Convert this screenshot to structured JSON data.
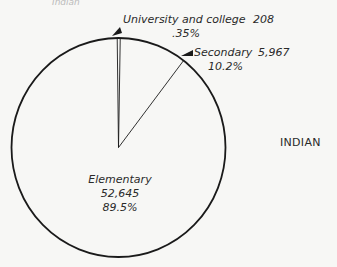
{
  "chart_data": {
    "type": "pie",
    "title": "INDIAN",
    "cut_off_text": "Indian",
    "slices": [
      {
        "label": "University and college",
        "value": 208,
        "percent_label": ".35%",
        "percent": 0.35
      },
      {
        "label": "Secondary",
        "value": 5967,
        "percent_label": "10.2%",
        "percent": 10.2
      },
      {
        "label": "Elementary",
        "value": 52645,
        "value_label": "52,645",
        "percent_label": "89.5%",
        "percent": 89.5
      }
    ],
    "value_labels": {
      "university": "208",
      "secondary": "5,967",
      "elementary": "52,645"
    },
    "start_angle": "top (12 o'clock)",
    "direction": "clockwise",
    "colors": {
      "stroke": "#1a1a1a",
      "fill": "#f7f7f5"
    }
  }
}
